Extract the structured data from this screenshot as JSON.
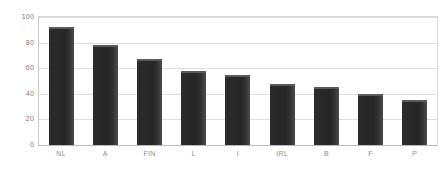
{
  "chart_data": {
    "type": "bar",
    "title": "",
    "subtitle": "",
    "xlabel": "",
    "ylabel": "",
    "categories": [
      "NL",
      "A",
      "FIN",
      "L",
      "I",
      "IRL",
      "B",
      "F",
      "P"
    ],
    "values": [
      92,
      78,
      67,
      58,
      55,
      48,
      45,
      40,
      35
    ],
    "ylim": [
      0,
      100
    ],
    "yticks": [
      0,
      20,
      40,
      60,
      80,
      100
    ],
    "ytick_labels": [
      "0",
      "20",
      "40",
      "60",
      "80",
      "100"
    ],
    "grid": true,
    "grid_axis": "y",
    "legend": false,
    "legend_position": "none",
    "series": [
      {
        "name": "",
        "values": [
          92,
          78,
          67,
          58,
          55,
          48,
          45,
          40,
          35
        ]
      }
    ],
    "annotations": []
  },
  "style": {
    "bar_color": "#262626",
    "bar_highlight_color": "#5a5a5a",
    "grid_color": "#dcdcdc",
    "axis_color": "#c9c9c9",
    "frame_color": "#d8d8d8",
    "tick_label_color": "#7a7a7a",
    "category_label_color": "#8a8a8a",
    "background_color": "#ffffff"
  }
}
